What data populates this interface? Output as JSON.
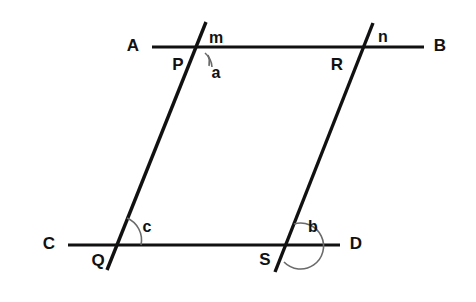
{
  "figure": {
    "background_color": "#ffffff",
    "line_color": "#111111",
    "arc_color": "#6a6a6a"
  },
  "lines": {
    "top_parallel": {
      "name": "AB",
      "start_label": "A",
      "end_label": "B",
      "x1": 152,
      "y1": 47,
      "x2": 424,
      "y2": 47
    },
    "bottom_parallel": {
      "name": "CD",
      "start_label": "C",
      "end_label": "D",
      "x1": 68,
      "y1": 245,
      "x2": 340,
      "y2": 245
    },
    "left_transversal": {
      "name": "m",
      "top_label": "m",
      "x1": 206,
      "y1": 22,
      "x2": 107,
      "y2": 270
    },
    "right_transversal": {
      "name": "n",
      "top_label": "n",
      "x1": 373,
      "y1": 23,
      "x2": 275,
      "y2": 272
    }
  },
  "points": [
    {
      "label": "A",
      "x": 133,
      "y": 47,
      "role": "line-endpoint-label"
    },
    {
      "label": "B",
      "x": 440,
      "y": 47,
      "role": "line-endpoint-label"
    },
    {
      "label": "C",
      "x": 49,
      "y": 245,
      "role": "line-endpoint-label"
    },
    {
      "label": "D",
      "x": 356,
      "y": 245,
      "role": "line-endpoint-label"
    },
    {
      "label": "P",
      "x": 178,
      "y": 66,
      "role": "intersection-label"
    },
    {
      "label": "R",
      "x": 337,
      "y": 66,
      "role": "intersection-label"
    },
    {
      "label": "Q",
      "x": 98,
      "y": 262,
      "role": "intersection-label"
    },
    {
      "label": "S",
      "x": 265,
      "y": 261,
      "role": "intersection-label"
    }
  ],
  "transversal_labels": [
    {
      "label": "m",
      "x": 216,
      "y": 39,
      "role": "transversal-name"
    },
    {
      "label": "n",
      "x": 383,
      "y": 38,
      "role": "transversal-name"
    }
  ],
  "angles": [
    {
      "label": "a",
      "vertex": "P",
      "x": 216,
      "y": 74,
      "arc": "M 208 55 A 18 18 0 0 1 209 66",
      "description": "angle below line AB on right of transversal m at P"
    },
    {
      "label": "c",
      "vertex": "Q",
      "x": 147,
      "y": 228,
      "arc": "M 130 219 A 21 21 0 0 1 138 245",
      "description": "angle above line CD on right of transversal m at Q"
    },
    {
      "label": "b",
      "vertex": "S",
      "x": 313,
      "y": 228,
      "arc": "M 290 226 A 22 22 0 1 1 281 260",
      "description": "reflex-style angle at S around right side of transversal n"
    }
  ]
}
